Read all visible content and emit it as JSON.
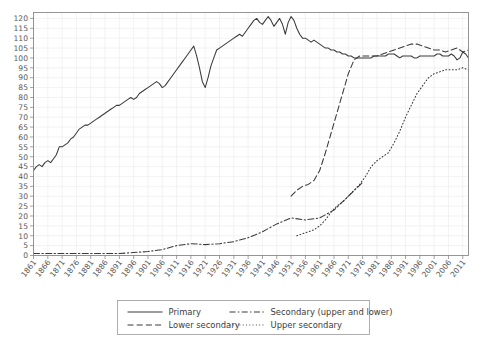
{
  "chart_data": {
    "type": "line",
    "title": "",
    "xlabel": "",
    "ylabel": "",
    "xlim": [
      1861,
      2013
    ],
    "ylim": [
      0,
      123
    ],
    "ytick_step": 5,
    "xtick_step": 5,
    "grid": true,
    "legend_position": "bottom",
    "yticks": [
      0,
      5,
      10,
      15,
      20,
      25,
      30,
      35,
      40,
      45,
      50,
      55,
      60,
      65,
      70,
      75,
      80,
      85,
      90,
      95,
      100,
      105,
      110,
      115,
      120
    ],
    "xticks": [
      1861,
      1866,
      1871,
      1876,
      1881,
      1886,
      1891,
      1896,
      1901,
      1906,
      1911,
      1916,
      1921,
      1926,
      1931,
      1936,
      1941,
      1946,
      1951,
      1956,
      1961,
      1966,
      1971,
      1976,
      1981,
      1986,
      1991,
      1996,
      2001,
      2006,
      2011
    ],
    "series": [
      {
        "name": "Primary",
        "style": "solid",
        "x": [
          1861,
          1862,
          1863,
          1864,
          1865,
          1866,
          1867,
          1868,
          1869,
          1870,
          1871,
          1872,
          1873,
          1874,
          1875,
          1876,
          1877,
          1878,
          1879,
          1880,
          1881,
          1882,
          1883,
          1884,
          1885,
          1886,
          1887,
          1888,
          1889,
          1890,
          1891,
          1892,
          1893,
          1894,
          1895,
          1896,
          1897,
          1898,
          1899,
          1900,
          1901,
          1902,
          1903,
          1904,
          1905,
          1906,
          1907,
          1908,
          1909,
          1910,
          1911,
          1912,
          1913,
          1914,
          1915,
          1916,
          1917,
          1918,
          1919,
          1920,
          1921,
          1922,
          1923,
          1924,
          1925,
          1926,
          1927,
          1928,
          1929,
          1930,
          1931,
          1932,
          1933,
          1934,
          1935,
          1936,
          1937,
          1938,
          1939,
          1940,
          1941,
          1942,
          1943,
          1944,
          1945,
          1946,
          1947,
          1948,
          1949,
          1950,
          1951,
          1952,
          1953,
          1954,
          1955,
          1956,
          1957,
          1958,
          1959,
          1960,
          1961,
          1962,
          1963,
          1964,
          1965,
          1966,
          1967,
          1968,
          1969,
          1970,
          1971,
          1972,
          1973,
          1974,
          1975,
          1976,
          1977,
          1978,
          1979,
          1980,
          1981,
          1982,
          1983,
          1984,
          1985,
          1986,
          1987,
          1988,
          1989,
          1990,
          1991,
          1992,
          1993,
          1994,
          1995,
          1996,
          1997,
          1998,
          1999,
          2000,
          2001,
          2002,
          2003,
          2004,
          2005,
          2006,
          2007,
          2008,
          2009,
          2010,
          2011,
          2012,
          2013
        ],
        "y": [
          43,
          45,
          46,
          45,
          47,
          48,
          47,
          49,
          51,
          55,
          55,
          56,
          57,
          59,
          60,
          62,
          64,
          65,
          66,
          66,
          67,
          68,
          69,
          70,
          71,
          72,
          73,
          74,
          75,
          76,
          76,
          77,
          78,
          79,
          80,
          79,
          80,
          82,
          83,
          84,
          85,
          86,
          87,
          88,
          87,
          85,
          86,
          88,
          90,
          92,
          94,
          96,
          98,
          100,
          102,
          104,
          106,
          101,
          95,
          88,
          85,
          90,
          96,
          100,
          104,
          105,
          106,
          107,
          108,
          109,
          110,
          111,
          112,
          111,
          113,
          115,
          117,
          119,
          120,
          118,
          117,
          119,
          121,
          119,
          116,
          118,
          120,
          117,
          112,
          118,
          121,
          119,
          115,
          112,
          110,
          110,
          109,
          108,
          109,
          108,
          107,
          106,
          105,
          105,
          104,
          104,
          103,
          103,
          102,
          102,
          101,
          101,
          100,
          100,
          100,
          100,
          100,
          100,
          100,
          101,
          101,
          101,
          101,
          101,
          102,
          102,
          102,
          101,
          100,
          101,
          101,
          101,
          101,
          100,
          100,
          101,
          101,
          101,
          101,
          101,
          101,
          102,
          102,
          101,
          101,
          101,
          102,
          101,
          99,
          100,
          103,
          102,
          100
        ]
      },
      {
        "name": "Secondary (upper and lower)",
        "style": "dashdot",
        "x": [
          1861,
          1866,
          1871,
          1876,
          1881,
          1886,
          1891,
          1896,
          1901,
          1906,
          1911,
          1916,
          1921,
          1926,
          1931,
          1936,
          1941,
          1946,
          1951,
          1956,
          1961,
          1966,
          1971,
          1976
        ],
        "y": [
          1,
          1,
          1,
          1,
          1,
          1,
          1,
          1.5,
          2,
          3,
          5,
          6,
          5.5,
          6,
          7,
          9,
          12,
          16,
          19,
          18,
          19,
          23,
          30,
          37
        ]
      },
      {
        "name": "Lower secondary",
        "style": "dashed",
        "x": [
          1951,
          1953,
          1955,
          1957,
          1959,
          1961,
          1963,
          1965,
          1967,
          1969,
          1971,
          1973,
          1975,
          1977,
          1979,
          1981,
          1983,
          1985,
          1987,
          1989,
          1991,
          1993,
          1995,
          1997,
          1999,
          2001,
          2003,
          2005,
          2007,
          2009,
          2011,
          2013
        ],
        "y": [
          30,
          33,
          35,
          36,
          38,
          43,
          52,
          62,
          72,
          82,
          92,
          99,
          101,
          101,
          101,
          101,
          102,
          103,
          104,
          105,
          106,
          107,
          107,
          106,
          105,
          104,
          104,
          103,
          104,
          105,
          103,
          104
        ]
      },
      {
        "name": "Upper secondary",
        "style": "dotted",
        "x": [
          1953,
          1955,
          1957,
          1959,
          1961,
          1963,
          1965,
          1967,
          1969,
          1971,
          1973,
          1975,
          1977,
          1979,
          1981,
          1983,
          1985,
          1987,
          1989,
          1991,
          1993,
          1995,
          1997,
          1999,
          2001,
          2003,
          2005,
          2007,
          2009,
          2011,
          2013
        ],
        "y": [
          10,
          11,
          12,
          13,
          15,
          18,
          22,
          25,
          27,
          30,
          33,
          36,
          40,
          45,
          48,
          50,
          52,
          57,
          63,
          70,
          76,
          82,
          86,
          90,
          92,
          93,
          94,
          94,
          94,
          95,
          94
        ]
      }
    ]
  },
  "legend": {
    "items": [
      {
        "label": "Primary",
        "style": "solid"
      },
      {
        "label": "Secondary (upper and lower)",
        "style": "dashdot"
      },
      {
        "label": "Lower secondary",
        "style": "dashed"
      },
      {
        "label": "Upper secondary",
        "style": "dotted"
      }
    ]
  }
}
